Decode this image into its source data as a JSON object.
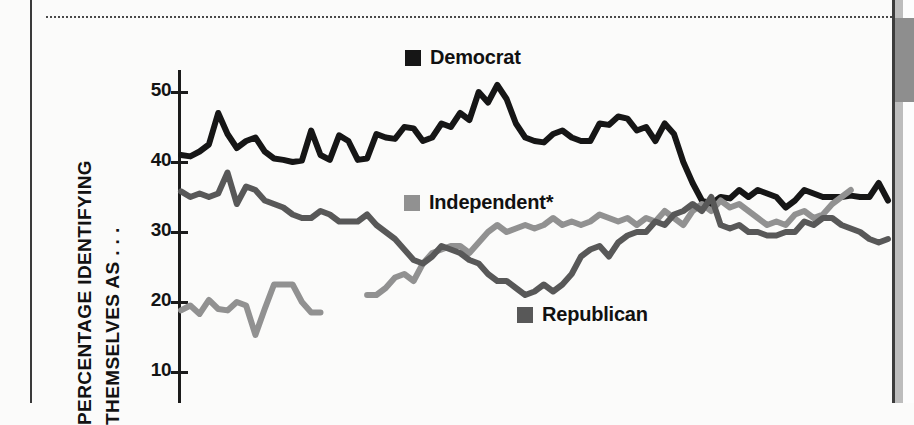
{
  "figure": {
    "background_color": "#fbfbfa",
    "side_tab_color": "#8e8e8e"
  },
  "axis": {
    "y_title_line1": "PERCENTAGE IDENTIFYING",
    "y_title_line2": "THEMSELVES AS . . .",
    "y_ticks": [
      "50",
      "40",
      "30",
      "20",
      "10"
    ]
  },
  "legend": {
    "democrat": {
      "label": "Democrat",
      "color": "#161616"
    },
    "independent": {
      "label": "Independent*",
      "color": "#919191"
    },
    "republican": {
      "label": "Republican",
      "color": "#585858"
    }
  },
  "chart_data": {
    "type": "line",
    "title": "",
    "xlabel": "",
    "ylabel": "PERCENTAGE IDENTIFYING THEMSELVES AS . . .",
    "ylim": [
      5,
      53
    ],
    "yticks": [
      10,
      20,
      30,
      40,
      50
    ],
    "grid": false,
    "legend_position": "inline-annotations",
    "note": "Chart is cropped at the bottom; the x axis line and its tick labels are not visible in the screenshot.",
    "series": [
      {
        "name": "Democrat",
        "color": "#161616",
        "values": [
          41.0,
          40.8,
          41.5,
          42.5,
          47.0,
          44.0,
          42.0,
          43.0,
          43.5,
          41.5,
          40.5,
          40.3,
          40.0,
          40.2,
          44.5,
          41.0,
          40.3,
          43.8,
          43.0,
          40.3,
          40.5,
          44.0,
          43.5,
          43.3,
          45.0,
          44.8,
          43.0,
          43.5,
          45.5,
          45.0,
          47.0,
          46.0,
          50.0,
          48.5,
          51.0,
          49.0,
          45.5,
          43.5,
          43.0,
          42.8,
          44.0,
          44.5,
          43.5,
          43.0,
          43.0,
          45.5,
          45.3,
          46.5,
          46.2,
          44.5,
          45.0,
          43.0,
          45.5,
          44.0,
          40.0,
          37.0,
          34.5,
          34.0,
          35.0,
          34.8,
          36.0,
          35.0,
          36.0,
          35.5,
          35.0,
          33.5,
          34.5,
          36.0,
          35.5,
          35.0,
          35.0,
          35.0,
          35.2,
          35.0,
          35.0,
          37.0,
          34.5
        ]
      },
      {
        "name": "Independent*",
        "color": "#919191",
        "segments": [
          {
            "values": [
              18.8,
              19.5,
              18.3,
              20.3,
              19.0,
              18.8,
              20.0,
              19.5,
              15.3,
              19.0,
              22.5,
              22.5,
              22.5,
              20.0,
              18.5,
              18.5
            ]
          },
          {
            "values": [
              21.0,
              21.0,
              22.0,
              23.5,
              24.0,
              23.0,
              25.5,
              27.0,
              27.5,
              28.0,
              28.0,
              27.0,
              28.5,
              30.0,
              31.0,
              30.0,
              30.5,
              31.0,
              30.5,
              31.0,
              32.0,
              31.0,
              31.5,
              31.0,
              31.5,
              32.5,
              32.0,
              31.5,
              32.0,
              31.0,
              32.0,
              31.5,
              33.0,
              32.0,
              31.0,
              33.0,
              34.0,
              33.0,
              34.5,
              33.5,
              34.0,
              33.0,
              32.0,
              31.0,
              31.5,
              31.0,
              32.5,
              33.0,
              32.0,
              32.5,
              34.0,
              35.0,
              36.0
            ]
          }
        ]
      },
      {
        "name": "Republican",
        "color": "#585858",
        "values": [
          35.8,
          35.0,
          35.5,
          35.0,
          35.5,
          38.5,
          34.0,
          36.5,
          36.0,
          34.5,
          34.0,
          33.5,
          32.5,
          32.0,
          32.0,
          33.0,
          32.5,
          31.5,
          31.5,
          31.5,
          32.5,
          31.0,
          30.0,
          29.0,
          27.5,
          26.0,
          25.5,
          26.5,
          28.0,
          27.5,
          27.0,
          26.0,
          25.5,
          24.0,
          23.0,
          23.0,
          22.0,
          21.0,
          21.5,
          22.5,
          21.5,
          22.5,
          24.0,
          26.5,
          27.5,
          28.0,
          26.5,
          28.5,
          29.5,
          30.0,
          30.0,
          31.5,
          31.0,
          32.5,
          33.0,
          34.0,
          33.0,
          35.0,
          31.0,
          30.5,
          31.0,
          30.0,
          30.0,
          29.5,
          29.5,
          30.0,
          30.0,
          31.5,
          31.0,
          32.0,
          32.0,
          31.0,
          30.5,
          30.0,
          29.0,
          28.5,
          29.0
        ]
      }
    ]
  }
}
